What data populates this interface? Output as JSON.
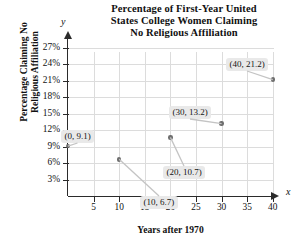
{
  "chart_data": {
    "type": "scatter",
    "title": "Percentage of First-Year United States College Women Claiming No Religious Affiliation",
    "title_lines": [
      "Percentage of First-Year United",
      "States College Women Claiming",
      "No Religious Affiliation"
    ],
    "xlabel": "Years after 1970",
    "ylabel": "Percentage Claiming No Religious Affiliation",
    "ylabel_lines": [
      "Percentage Claiming No",
      "Religious Affiliation"
    ],
    "axis_name_x": "x",
    "axis_name_y": "y",
    "x": [
      0,
      10,
      20,
      30,
      40
    ],
    "values": [
      9.1,
      6.7,
      10.7,
      13.2,
      21.2
    ],
    "point_labels": [
      "(0, 9.1)",
      "(10, 6.7)",
      "(20, 10.7)",
      "(30, 13.2)",
      "(40, 21.2)"
    ],
    "xticks": [
      5,
      10,
      15,
      20,
      25,
      30,
      35,
      40
    ],
    "xtick_labels": [
      "5",
      "10",
      "15",
      "20",
      "25",
      "30",
      "35",
      "40"
    ],
    "yticks": [
      3,
      6,
      9,
      12,
      15,
      18,
      21,
      24,
      27
    ],
    "ytick_labels": [
      "3%",
      "6%",
      "9%",
      "12%",
      "15%",
      "18%",
      "21%",
      "24%",
      "27%"
    ],
    "xlim": [
      0,
      45
    ],
    "ylim": [
      0,
      28.5
    ],
    "grid": true,
    "legend": null,
    "colors": {
      "marker": "#6e6e6e",
      "grid": "#dcdcdc",
      "axis": "#2b2b2b",
      "callout_bg": "#e9e9e9",
      "text": "#111111"
    }
  }
}
